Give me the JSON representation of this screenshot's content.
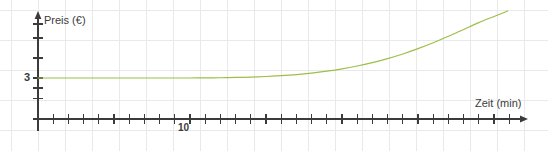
{
  "figure": {
    "width": 548,
    "height": 151,
    "background_color": "#ffffff",
    "grid_color": "#e8e8ea",
    "axis_color": "#3b3b3b",
    "curve_color": "#9cbf4a"
  },
  "labels": {
    "y_axis_title": "Preis (€)",
    "x_axis_title": "Zeit (min)",
    "y_tick_3": "3",
    "x_tick_10": "10"
  },
  "chart_data": {
    "type": "line",
    "title": "",
    "subtitle": "",
    "xlabel": "Zeit (min)",
    "ylabel": "Preis (€)",
    "xlim": [
      0,
      32
    ],
    "ylim": [
      0,
      7.3
    ],
    "xticks": [
      0,
      1,
      2,
      3,
      4,
      5,
      6,
      7,
      8,
      9,
      10,
      11,
      12,
      13,
      14,
      15,
      16,
      17,
      18,
      19,
      20,
      21,
      22,
      23,
      24,
      25,
      26,
      27,
      28,
      29,
      30,
      31
    ],
    "xtick_labels": [
      "",
      "",
      "",
      "",
      "",
      "",
      "",
      "",
      "",
      "",
      "10",
      "",
      "",
      "",
      "",
      "",
      "",
      "",
      "",
      "",
      "",
      "",
      "",
      "",
      "",
      "",
      "",
      "",
      "",
      "",
      "",
      ""
    ],
    "yticks": [
      1,
      2,
      3,
      4,
      5
    ],
    "ytick_labels": [
      "",
      "",
      "3",
      "",
      ""
    ],
    "grid": true,
    "legend": null,
    "legend_position": "none",
    "annotations": [],
    "series": [
      {
        "name": "Preis",
        "color": "#9cbf4a",
        "line_width": 1,
        "x": [
          0,
          1,
          2,
          3,
          4,
          5,
          6,
          7,
          8,
          9,
          10,
          11,
          12,
          13,
          14,
          15,
          16,
          17,
          18,
          19,
          20,
          21,
          22,
          23,
          24,
          25,
          26,
          27,
          28,
          29,
          30,
          30.9
        ],
        "y": [
          3.0,
          3.0,
          3.0,
          3.0,
          3.0,
          3.0,
          3.0,
          3.0,
          3.0,
          3.0,
          3.0,
          3.01,
          3.02,
          3.04,
          3.07,
          3.11,
          3.17,
          3.25,
          3.36,
          3.5,
          3.67,
          3.88,
          4.13,
          4.42,
          4.76,
          5.15,
          5.58,
          6.05,
          6.55,
          7.05,
          7.5,
          7.9
        ]
      }
    ]
  }
}
